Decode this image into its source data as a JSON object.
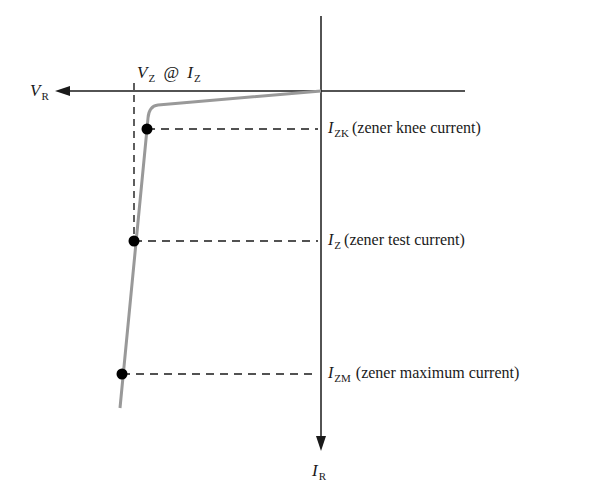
{
  "axes": {
    "horizontal": {
      "symbol": "V",
      "subscript": "R"
    },
    "vertical": {
      "symbol": "I",
      "subscript": "R"
    }
  },
  "top_label": {
    "v_symbol": "V",
    "v_sub": "Z",
    "at": "@",
    "i_symbol": "I",
    "i_sub": "Z"
  },
  "points": [
    {
      "symbol": "I",
      "subscript": "ZK",
      "description": "(zener knee current)",
      "x": 147,
      "y": 129
    },
    {
      "symbol": "I",
      "subscript": "Z",
      "description": "(zener test current)",
      "x": 134,
      "y": 241
    },
    {
      "symbol": "I",
      "subscript": "ZM",
      "description": "(zener maximum current)",
      "x": 122,
      "y": 374
    }
  ],
  "colors": {
    "axis": "#1a1a1a",
    "curve": "#999999",
    "dash": "#1a1a1a",
    "dot": "#000000"
  }
}
